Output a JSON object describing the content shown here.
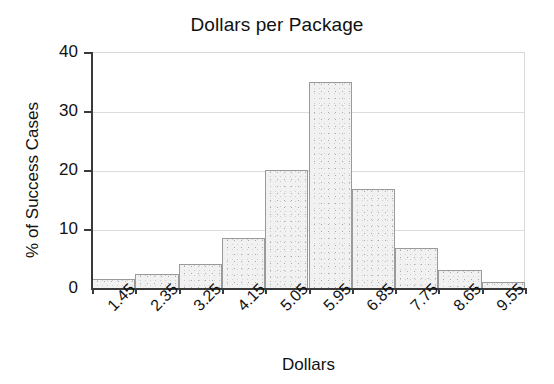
{
  "chart_data": {
    "type": "bar",
    "title": "Dollars per Package",
    "subtitle": "",
    "xlabel": "Dollars",
    "ylabel": "% of Success Cases",
    "categories": [
      "1.45",
      "2.35",
      "3.25",
      "4.15",
      "5.05",
      "5.95",
      "6.85",
      "7.75",
      "8.65",
      "9.55"
    ],
    "values": [
      1.5,
      2.4,
      4.0,
      8.5,
      20.0,
      35.0,
      16.7,
      6.8,
      3.0,
      1.0
    ],
    "series": [
      {
        "name": "% of Success Cases",
        "values": [
          1.5,
          2.4,
          4.0,
          8.5,
          20.0,
          35.0,
          16.7,
          6.8,
          3.0,
          1.0
        ]
      }
    ],
    "ylim": [
      0,
      40
    ],
    "yticks": [
      0,
      10,
      20,
      30,
      40
    ],
    "ytick_labels": [
      "0",
      "10",
      "20",
      "30",
      "40"
    ],
    "grid": "horizontal",
    "legend": "none",
    "annotations": [],
    "bar_fill": "#f1f1f1",
    "bar_edge": "#9a9a9a",
    "axis_color": "#3a3a3a",
    "grid_color": "#dcdcdc"
  }
}
